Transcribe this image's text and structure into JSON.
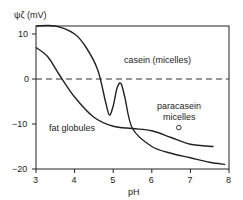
{
  "chart_data": {
    "type": "line",
    "title": "",
    "xlabel": "pH",
    "ylabel": "ψζ (mV)",
    "xlim": [
      3,
      8
    ],
    "ylim": [
      -20,
      12
    ],
    "xticks": [
      "3",
      "4",
      "5",
      "6",
      "7",
      "8"
    ],
    "yticks": [
      "10",
      "0",
      "−10",
      "−20"
    ],
    "grid": false,
    "reference_line": {
      "y": 0,
      "style": "dashed"
    },
    "series": [
      {
        "name": "casein (micelles)",
        "x": [
          3.0,
          3.5,
          4.0,
          4.3,
          4.6,
          4.8,
          4.9,
          5.0,
          5.1,
          5.2,
          5.3,
          5.5,
          6.0,
          6.5,
          7.0,
          7.5,
          7.9
        ],
        "values": [
          12,
          12,
          10,
          7,
          2,
          -5,
          -8,
          -6,
          -2,
          -1,
          -4,
          -11,
          -15,
          -16.5,
          -17.5,
          -18.5,
          -19
        ]
      },
      {
        "name": "fat globules",
        "x": [
          3.0,
          3.3,
          3.6,
          4.0,
          4.5,
          5.0,
          5.5,
          6.0,
          6.5,
          7.0,
          7.6
        ],
        "values": [
          7,
          5,
          1,
          -4,
          -8.5,
          -10.5,
          -11,
          -11.5,
          -13,
          -14.5,
          -15
        ]
      }
    ],
    "points": [
      {
        "name": "paracasein micelles",
        "x": 6.7,
        "y": -10.8
      }
    ],
    "annotations": [
      "casein (micelles)",
      "fat globules",
      "paracasein micelles"
    ]
  },
  "labels": {
    "ylabel": "ψζ (mV)",
    "xlabel": "pH",
    "casein": "casein (micelles)",
    "fat": "fat globules",
    "para1": "paracasein",
    "para2": "micelles"
  }
}
